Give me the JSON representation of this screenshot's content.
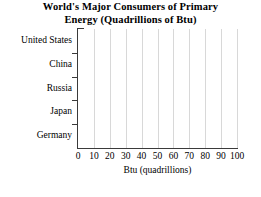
{
  "chart_data": {
    "type": "bar",
    "orientation": "horizontal",
    "title": "World's Major Consumers of Primary Energy (Quadrillions of Btu)",
    "title_lines": [
      "World's Major Consumers of Primary",
      "Energy (Quadrillions of Btu)"
    ],
    "categories": [
      "United States",
      "China",
      "Russia",
      "Japan",
      "Germany"
    ],
    "values": [
      null,
      null,
      null,
      null,
      null
    ],
    "series": [
      {
        "name": "Btu (quadrillions)",
        "values": [
          null,
          null,
          null,
          null,
          null
        ]
      }
    ],
    "xlabel": "Btu (quadrillions)",
    "ylabel": "",
    "xlim": [
      0,
      100
    ],
    "xticks": [
      0,
      10,
      20,
      30,
      40,
      50,
      60,
      70,
      80,
      90,
      100
    ],
    "xtick_labels": [
      "0",
      "10",
      "20",
      "30",
      "40",
      "50",
      "60",
      "70",
      "80",
      "90",
      "100"
    ],
    "grid": true,
    "grid_axis": "x",
    "grid_color": "#d8d8d8",
    "legend": false,
    "legend_position": "none",
    "note": "Empty plot area - no bars plotted; blank chart template for data entry",
    "axis_color": "#3a3a3a",
    "background_color": "#ffffff"
  }
}
